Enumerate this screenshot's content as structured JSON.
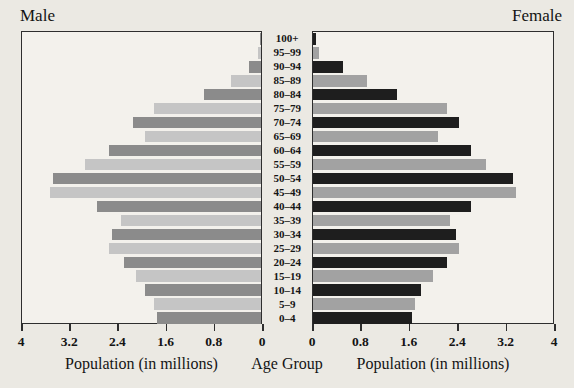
{
  "titles": {
    "left": "Male",
    "right": "Female",
    "x_axis": "Population (in millions)",
    "center_axis": "Age Group"
  },
  "colors": {
    "page_background": "#ebe9e3",
    "plot_background": "#f3f1ec",
    "border": "#2e2e2e",
    "male_dark": "#8b8b8b",
    "male_light": "#c5c5c5",
    "female_dark": "#1e1e1e",
    "female_light": "#a2a2a2"
  },
  "chart_data": {
    "type": "bar",
    "variant": "population-pyramid",
    "xlabel": "Population (in millions)",
    "center_label": "Age Group",
    "xlim": [
      0,
      4
    ],
    "x_ticks": [
      0,
      0.8,
      1.6,
      2.4,
      3.2,
      4
    ],
    "x_tick_labels": [
      "0",
      "0.8",
      "1.6",
      "2.4",
      "3.2",
      "4"
    ],
    "left_axis_tick_labels": [
      "4",
      "3.2",
      "2.4",
      "1.6",
      "0.8",
      "0"
    ],
    "grid": false,
    "age_groups": [
      "100+",
      "95–99",
      "90–94",
      "85–89",
      "80–84",
      "75–79",
      "70–74",
      "65–69",
      "60–64",
      "55–59",
      "50–54",
      "45–49",
      "40–44",
      "35–39",
      "30–34",
      "25–29",
      "20–24",
      "15–19",
      "10–14",
      "5–9",
      "0–4"
    ],
    "series": [
      {
        "name": "Male",
        "side": "left",
        "values": [
          0.02,
          0.05,
          0.2,
          0.5,
          0.95,
          1.8,
          2.15,
          1.95,
          2.55,
          2.95,
          3.5,
          3.55,
          2.75,
          2.35,
          2.5,
          2.55,
          2.3,
          2.1,
          1.95,
          1.8,
          1.75
        ]
      },
      {
        "name": "Female",
        "side": "right",
        "values": [
          0.05,
          0.1,
          0.5,
          0.9,
          1.4,
          2.25,
          2.45,
          2.1,
          2.65,
          2.9,
          3.35,
          3.4,
          2.65,
          2.3,
          2.4,
          2.45,
          2.25,
          2.0,
          1.8,
          1.7,
          1.65
        ]
      }
    ]
  }
}
